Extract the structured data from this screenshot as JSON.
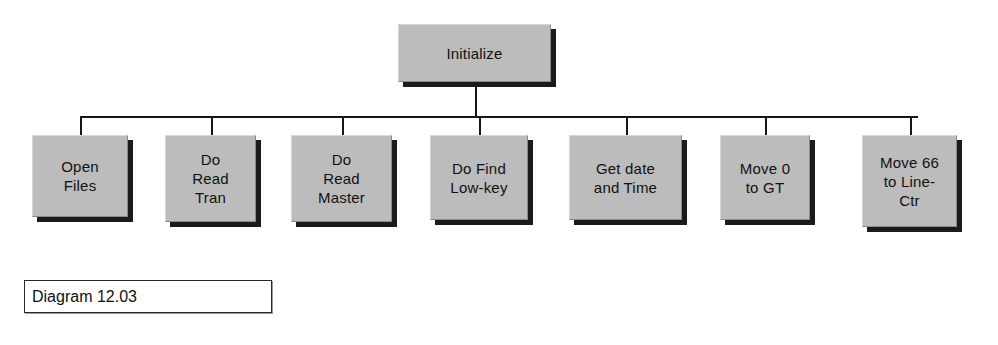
{
  "diagram": {
    "kind": "structure-chart",
    "root": {
      "label": "Initialize",
      "x": 398,
      "y": 24,
      "w": 153,
      "h": 58
    },
    "bus": {
      "y": 116,
      "x_start": 80,
      "x_end": 918,
      "root_stem_top": 82,
      "children_top": 135
    },
    "children": [
      {
        "label": "Open\nFiles",
        "x": 32,
        "y": 135,
        "w": 96,
        "h": 82
      },
      {
        "label": "Do\nRead\nTran",
        "x": 165,
        "y": 135,
        "w": 91,
        "h": 87
      },
      {
        "label": "Do\nRead\nMaster",
        "x": 291,
        "y": 135,
        "w": 101,
        "h": 87
      },
      {
        "label": "Do Find\nLow-key",
        "x": 430,
        "y": 135,
        "w": 98,
        "h": 85
      },
      {
        "label": "Get date\nand Time",
        "x": 569,
        "y": 135,
        "w": 113,
        "h": 85
      },
      {
        "label": "Move 0\nto GT",
        "x": 720,
        "y": 135,
        "w": 90,
        "h": 85
      },
      {
        "label": "Move 66\nto Line-\nCtr",
        "x": 862,
        "y": 135,
        "w": 95,
        "h": 92
      }
    ],
    "caption": {
      "text": "Diagram 12.03",
      "x": 24,
      "y": 280,
      "w": 248,
      "h": 33
    },
    "colors": {
      "box_fill": "#bcbcbc",
      "box_shadow": "#1b1b1b",
      "line": "#171717",
      "text": "#111111",
      "caption_fill": "#ffffff",
      "caption_border": "#2a2a2a",
      "background": "#ffffff"
    }
  }
}
